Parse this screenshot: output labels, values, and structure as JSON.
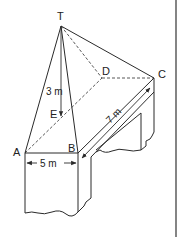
{
  "diagram": {
    "type": "3d-geometry",
    "vertices": {
      "T": {
        "label": "T"
      },
      "A": {
        "label": "A"
      },
      "B": {
        "label": "B"
      },
      "C": {
        "label": "C"
      },
      "D": {
        "label": "D"
      },
      "E": {
        "label": "E"
      }
    },
    "dimensions": {
      "height_TE": "3 m",
      "AB": "5 m",
      "BC": "7 m"
    }
  }
}
